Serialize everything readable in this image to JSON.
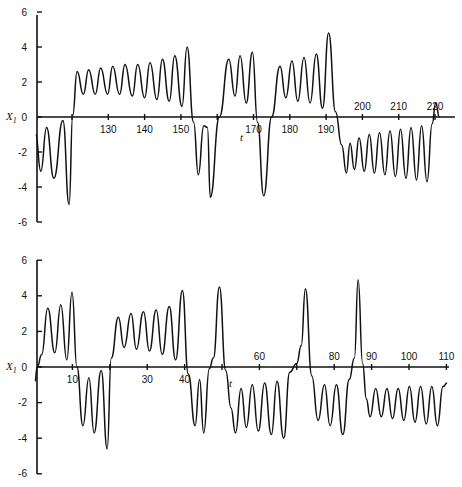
{
  "chart_data": [
    {
      "type": "line",
      "title": "",
      "xlabel": "t",
      "ylabel": "X1",
      "xlim": [
        110,
        225
      ],
      "ylim": [
        -6,
        6
      ],
      "grid": false,
      "legend": null,
      "x_ticks": [
        120,
        130,
        140,
        150,
        160,
        170,
        180,
        190,
        200,
        210,
        220
      ],
      "x_tick_labels": [
        "",
        "130",
        "140",
        "150",
        "",
        "170",
        "180",
        "190",
        "200",
        "210",
        "220"
      ],
      "y_ticks": [
        6,
        4,
        2,
        0,
        -2,
        -4,
        -6
      ],
      "y_tick_labels": [
        "6",
        "4",
        "2",
        "0",
        "-2",
        "-4",
        "-6"
      ],
      "series": [
        {
          "name": "X1(t)",
          "x": [
            110,
            111.4,
            113,
            115,
            117.5,
            119.2,
            120.2,
            121.4,
            123.1,
            124.6,
            126.4,
            127.9,
            129.8,
            131.2,
            133.1,
            134.6,
            136.6,
            138.1,
            140,
            141.5,
            143.4,
            144.9,
            146.8,
            148.3,
            150.3,
            151.7,
            153.5,
            154.8,
            156.3,
            157.3,
            158.1,
            160.6,
            163.2,
            164.9,
            166.3,
            168,
            169.7,
            171.1,
            172.8,
            175,
            177.3,
            178.9,
            180.6,
            182.2,
            183.9,
            185.6,
            187.3,
            189,
            190.7,
            192.6,
            194.3,
            195.6,
            196.6,
            197.8,
            199.1,
            200.5,
            201.9,
            203.3,
            204.7,
            206.2,
            207.6,
            209.1,
            210.5,
            212,
            213.4,
            214.9,
            216.3,
            217.8,
            219.2,
            220.2,
            221.2
          ],
          "values": [
            -1.0,
            -3.1,
            -0.6,
            -3.5,
            -0.2,
            -5.0,
            0.1,
            2.6,
            1.3,
            2.7,
            1.3,
            2.8,
            1.3,
            2.9,
            1.3,
            3.0,
            1.2,
            3.0,
            1.1,
            3.1,
            1.0,
            3.3,
            0.9,
            3.5,
            0.6,
            4.0,
            -0.3,
            -3.3,
            -0.5,
            -0.6,
            -4.6,
            0.0,
            3.3,
            1.2,
            3.5,
            0.8,
            3.7,
            -0.3,
            -4.5,
            0.0,
            2.9,
            1.1,
            3.2,
            0.9,
            3.4,
            0.8,
            3.6,
            0.5,
            4.8,
            0.3,
            -1.6,
            -3.2,
            -1.5,
            -3.0,
            -1.2,
            -3.1,
            -1.0,
            -3.2,
            -0.9,
            -3.3,
            -0.8,
            -3.4,
            -0.7,
            -3.5,
            -0.6,
            -3.6,
            -0.5,
            -3.7,
            -0.4,
            0.8,
            0.0
          ]
        }
      ]
    },
    {
      "type": "line",
      "title": "",
      "xlabel": "t",
      "ylabel": "X1",
      "xlim": [
        0,
        112
      ],
      "ylim": [
        -6,
        6
      ],
      "grid": false,
      "legend": null,
      "x_ticks": [
        10,
        20,
        30,
        40,
        50,
        60,
        70,
        80,
        90,
        100,
        110
      ],
      "x_tick_labels": [
        "10",
        "",
        "30",
        "40",
        "",
        "60",
        "",
        "80",
        "90",
        "100",
        "110"
      ],
      "y_ticks": [
        6,
        4,
        2,
        0,
        -2,
        -4,
        -6
      ],
      "y_tick_labels": [
        "6",
        "4",
        "2",
        "0",
        "-2",
        "-4",
        "-6"
      ],
      "series": [
        {
          "name": "X1(t)",
          "x": [
            0,
            0.6,
            1.8,
            3.4,
            5.3,
            6.9,
            8.5,
            9.9,
            11.2,
            12.8,
            14.4,
            15.8,
            17.7,
            19.3,
            20.4,
            22.3,
            23.8,
            25.7,
            27.1,
            29,
            30.6,
            32.4,
            34,
            35.9,
            37.6,
            39.4,
            41,
            42.8,
            44,
            45.1,
            46.6,
            47.7,
            49.3,
            51,
            52.4,
            53.6,
            55.1,
            56.5,
            58.1,
            59.7,
            61.4,
            63.2,
            64.7,
            66.5,
            68.1,
            70,
            71.2,
            72.3,
            74,
            75.7,
            77.4,
            78.9,
            80.6,
            82.3,
            84,
            85.4,
            86.4,
            87.6,
            88.6,
            89.6,
            91.1,
            92.6,
            94.1,
            95.6,
            97.1,
            98.6,
            100.1,
            101.6,
            103.1,
            104.6,
            106.1,
            107.6,
            109.1,
            110.2
          ],
          "values": [
            -0.8,
            0.0,
            0.7,
            3.3,
            0.8,
            3.5,
            0.4,
            4.2,
            0.0,
            -3.3,
            -0.6,
            -3.7,
            -0.2,
            -4.6,
            0.5,
            2.8,
            1.1,
            3.0,
            1.0,
            3.1,
            0.9,
            3.2,
            0.7,
            3.4,
            0.4,
            4.3,
            -0.4,
            -3.3,
            -0.7,
            -3.7,
            -0.1,
            0.5,
            4.5,
            -0.2,
            -2.3,
            -3.7,
            -1.2,
            -3.4,
            -1.0,
            -3.6,
            -0.9,
            -3.8,
            -0.8,
            -4.0,
            -0.3,
            0.2,
            1.2,
            4.4,
            -0.5,
            -3.0,
            -1.0,
            -3.3,
            -1.0,
            -3.8,
            -0.7,
            0.5,
            4.9,
            0.2,
            -1.8,
            -2.8,
            -1.2,
            -2.8,
            -1.2,
            -2.9,
            -1.2,
            -3.0,
            -1.1,
            -3.1,
            -1.1,
            -3.2,
            -1.1,
            -3.3,
            -1.1,
            -0.9
          ]
        }
      ]
    }
  ],
  "panels": [
    {
      "ylabel": "X",
      "ylabel_sub": "1",
      "xlabel": "t"
    },
    {
      "ylabel": "X",
      "ylabel_sub": "1",
      "xlabel": "t"
    }
  ]
}
